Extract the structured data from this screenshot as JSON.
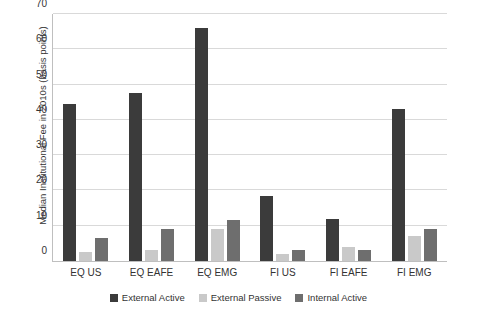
{
  "chart_data": {
    "type": "bar",
    "title": "",
    "xlabel": "",
    "ylabel": "Median Institutional Fee in 2010s (basis points)",
    "ylim": [
      0,
      70
    ],
    "yticks": [
      0,
      10,
      20,
      30,
      40,
      50,
      60,
      70
    ],
    "grid": true,
    "legend_position": "bottom",
    "categories": [
      "EQ US",
      "EQ EAFE",
      "EQ EMG",
      "FI US",
      "FI EAFE",
      "FI EMG"
    ],
    "series": [
      {
        "name": "External Active",
        "color": "#3b3b3b",
        "values": [
          44.5,
          47.5,
          66,
          18.5,
          12,
          43
        ]
      },
      {
        "name": "External Passive",
        "color": "#c9c9c9",
        "values": [
          2.5,
          3,
          9,
          2,
          4,
          7
        ]
      },
      {
        "name": "Internal Active",
        "color": "#6e6e6e",
        "values": [
          6.5,
          9,
          11.5,
          3,
          3,
          9
        ]
      }
    ]
  },
  "axis": {
    "y_title": "Median Institutional Fee in 2010s (basis points)",
    "y_tick_labels": [
      "0",
      "10",
      "20",
      "30",
      "40",
      "50",
      "60",
      "70"
    ],
    "x_tick_labels": [
      "EQ US",
      "EQ EAFE",
      "EQ EMG",
      "FI US",
      "FI EAFE",
      "FI EMG"
    ]
  },
  "legend": {
    "items": [
      {
        "label": "External Active",
        "color": "#3b3b3b"
      },
      {
        "label": "External Passive",
        "color": "#c9c9c9"
      },
      {
        "label": "Internal Active",
        "color": "#6e6e6e"
      }
    ]
  }
}
